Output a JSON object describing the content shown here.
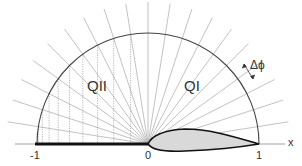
{
  "diagram": {
    "title": "",
    "axis": {
      "label": "x",
      "ticks": [
        {
          "label": "-1",
          "value": -1
        },
        {
          "label": "0",
          "value": 0
        },
        {
          "label": "1",
          "value": 1
        }
      ]
    },
    "regions": {
      "q1": "QI",
      "q2": "QII"
    },
    "annotation": {
      "delta_phi": "Δϕ"
    },
    "colors": {
      "lines": "#9a9a9a",
      "arc": "#444444",
      "airfoil_fill": "#d9d9d9",
      "airfoil_stroke": "#111111",
      "axis": "#888888"
    },
    "geometry": {
      "origin_px": [
        148,
        144
      ],
      "radius_px": 111,
      "ray_count": 21,
      "ray_angle_step_deg": 9
    }
  }
}
